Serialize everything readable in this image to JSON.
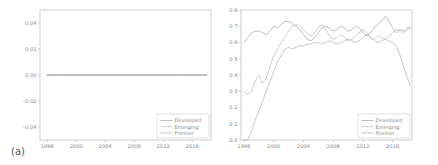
{
  "figure": {
    "background": "#ffffff",
    "line_color": "#9a9a9a",
    "axis_color": "#b9b9b9",
    "text_color": "#8a8a8a"
  },
  "panels": [
    {
      "tag": "(a)",
      "legend_position": "lower right",
      "legend": [
        {
          "label": "Developed",
          "style": "solid"
        },
        {
          "label": "Emerging",
          "style": "dotted"
        },
        {
          "label": "Frontier",
          "style": "dashdot"
        }
      ]
    },
    {
      "tag": "(b)",
      "legend_position": "lower right",
      "legend": [
        {
          "label": "Developed",
          "style": "solid"
        },
        {
          "label": "Emerging",
          "style": "dotted"
        },
        {
          "label": "Frontier",
          "style": "dashdot"
        }
      ]
    }
  ],
  "chart_data": [
    {
      "type": "line",
      "title": "",
      "panel": "(a)",
      "xlabel": "",
      "ylabel": "",
      "xlim": [
        1995.0,
        2018.6
      ],
      "ylim": [
        -0.05,
        0.05
      ],
      "xticks": [
        1996,
        2000,
        2004,
        2008,
        2012,
        2016
      ],
      "yticks": [
        -0.04,
        -0.02,
        0.0,
        0.02,
        0.04
      ],
      "ytick_labels": [
        "-0.04",
        "-0.02",
        "0.00",
        "0.02",
        "0.04"
      ],
      "grid": false,
      "legend": [
        "Developed",
        "Emerging",
        "Frontier"
      ],
      "series": [
        {
          "name": "Developed",
          "style": "solid",
          "x": [
            1996.0,
            1998.0,
            2000.0,
            2002.0,
            2004.0,
            2006.0,
            2008.0,
            2010.0,
            2012.0,
            2014.0,
            2016.0,
            2018.0
          ],
          "values": [
            0.0,
            0.0,
            0.0,
            0.0,
            0.0,
            0.0,
            0.0,
            0.0,
            0.0,
            0.0,
            0.0,
            0.0
          ]
        },
        {
          "name": "Emerging",
          "style": "dotted",
          "x": [
            1996.0,
            1998.0,
            2000.0,
            2002.0,
            2004.0,
            2006.0,
            2008.0,
            2010.0,
            2012.0,
            2014.0,
            2016.0,
            2018.0
          ],
          "values": [
            0.0,
            0.0,
            0.0,
            0.0,
            0.0,
            0.0,
            0.0,
            0.0,
            0.0,
            0.0,
            0.0,
            0.0
          ]
        },
        {
          "name": "Frontier",
          "style": "dashdot",
          "x": [
            1996.0,
            1998.0,
            2000.0,
            2002.0,
            2004.0,
            2006.0,
            2008.0,
            2010.0,
            2012.0,
            2014.0,
            2016.0,
            2018.0
          ],
          "values": [
            0.0,
            0.0,
            0.0,
            0.0,
            0.0,
            0.0,
            0.0,
            0.0,
            0.0,
            0.0,
            0.0,
            0.0
          ]
        }
      ]
    },
    {
      "type": "line",
      "title": "",
      "panel": "(b)",
      "xlabel": "",
      "ylabel": "",
      "xlim": [
        1995.6,
        2018.6
      ],
      "ylim": [
        0.0,
        0.8
      ],
      "xticks": [
        1996,
        2000,
        2004,
        2008,
        2012,
        2016
      ],
      "yticks": [
        0.0,
        0.1,
        0.2,
        0.3,
        0.4,
        0.5,
        0.6,
        0.7,
        0.8
      ],
      "ytick_labels": [
        "0.0",
        "0.1",
        "0.2",
        "0.3",
        "0.4",
        "0.5",
        "0.6",
        "0.7",
        "0.8"
      ],
      "grid": false,
      "legend": [
        "Developed",
        "Emerging",
        "Frontier"
      ],
      "series": [
        {
          "name": "Developed",
          "style": "solid",
          "x": [
            1996.0,
            1996.5,
            1997.0,
            1997.5,
            1998.0,
            1998.5,
            1999.0,
            1999.5,
            2000.0,
            2000.5,
            2001.0,
            2001.5,
            2002.0,
            2002.5,
            2003.0,
            2003.5,
            2004.0,
            2004.5,
            2005.0,
            2005.5,
            2006.0,
            2006.5,
            2007.0,
            2007.5,
            2008.0,
            2008.5,
            2009.0,
            2009.5,
            2010.0,
            2010.5,
            2011.0,
            2011.5,
            2012.0,
            2012.5,
            2013.0,
            2013.5,
            2014.0,
            2014.5,
            2015.0,
            2015.5,
            2016.0,
            2016.5,
            2017.0,
            2017.5,
            2018.0,
            2018.4
          ],
          "values": [
            0.6,
            0.63,
            0.66,
            0.67,
            0.67,
            0.66,
            0.65,
            0.67,
            0.7,
            0.69,
            0.71,
            0.73,
            0.73,
            0.72,
            0.7,
            0.68,
            0.65,
            0.62,
            0.61,
            0.63,
            0.66,
            0.69,
            0.7,
            0.69,
            0.67,
            0.68,
            0.7,
            0.69,
            0.67,
            0.68,
            0.7,
            0.69,
            0.66,
            0.64,
            0.66,
            0.69,
            0.71,
            0.73,
            0.76,
            0.73,
            0.69,
            0.66,
            0.68,
            0.67,
            0.69,
            0.69
          ]
        },
        {
          "name": "Emerging",
          "style": "dotted",
          "x": [
            1996.0,
            1996.5,
            1997.0,
            1997.5,
            1998.0,
            1998.5,
            1999.0,
            1999.5,
            2000.0,
            2000.5,
            2001.0,
            2001.5,
            2002.0,
            2002.5,
            2003.0,
            2003.5,
            2004.0,
            2004.5,
            2005.0,
            2005.5,
            2006.0,
            2006.5,
            2007.0,
            2007.5,
            2008.0,
            2008.5,
            2009.0,
            2009.5,
            2010.0,
            2010.5,
            2011.0,
            2011.5,
            2012.0,
            2012.5,
            2013.0,
            2013.5,
            2014.0,
            2014.5,
            2015.0,
            2015.5,
            2016.0,
            2016.5,
            2017.0,
            2017.5,
            2018.0,
            2018.4
          ],
          "values": [
            0.3,
            0.28,
            0.3,
            0.36,
            0.4,
            0.35,
            0.38,
            0.45,
            0.52,
            0.56,
            0.6,
            0.63,
            0.67,
            0.7,
            0.71,
            0.7,
            0.68,
            0.66,
            0.64,
            0.66,
            0.69,
            0.71,
            0.68,
            0.64,
            0.62,
            0.63,
            0.65,
            0.63,
            0.61,
            0.62,
            0.64,
            0.66,
            0.68,
            0.66,
            0.63,
            0.62,
            0.64,
            0.63,
            0.62,
            0.64,
            0.66,
            0.68,
            0.67,
            0.66,
            0.68,
            0.69
          ]
        },
        {
          "name": "Frontier",
          "style": "dashdot",
          "x": [
            1996.0,
            1996.5,
            1997.0,
            1997.5,
            1998.0,
            1998.5,
            1999.0,
            1999.5,
            2000.0,
            2000.5,
            2001.0,
            2001.5,
            2002.0,
            2002.5,
            2003.0,
            2003.5,
            2004.0,
            2004.5,
            2005.0,
            2005.5,
            2006.0,
            2006.5,
            2007.0,
            2007.5,
            2008.0,
            2008.5,
            2009.0,
            2009.5,
            2010.0,
            2010.5,
            2011.0,
            2011.5,
            2012.0,
            2012.5,
            2013.0,
            2013.5,
            2014.0,
            2014.5,
            2015.0,
            2015.5,
            2016.0,
            2016.5,
            2017.0,
            2017.5,
            2018.0,
            2018.4
          ],
          "values": [
            0.0,
            0.0,
            0.05,
            0.12,
            0.18,
            0.24,
            0.3,
            0.36,
            0.42,
            0.48,
            0.52,
            0.56,
            0.57,
            0.56,
            0.57,
            0.58,
            0.58,
            0.59,
            0.59,
            0.6,
            0.6,
            0.59,
            0.6,
            0.61,
            0.6,
            0.59,
            0.6,
            0.61,
            0.62,
            0.61,
            0.6,
            0.61,
            0.63,
            0.65,
            0.63,
            0.61,
            0.6,
            0.61,
            0.62,
            0.61,
            0.6,
            0.58,
            0.52,
            0.45,
            0.38,
            0.33
          ]
        }
      ]
    }
  ]
}
